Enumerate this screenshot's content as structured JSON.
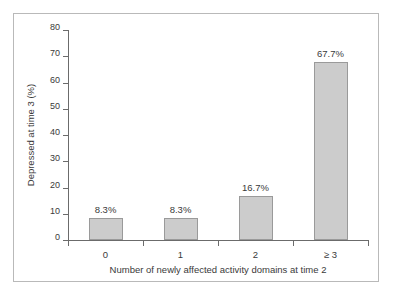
{
  "chart_data": {
    "type": "bar",
    "title": "",
    "categories": [
      "0",
      "1",
      "2",
      "≥ 3"
    ],
    "values": [
      8.3,
      8.3,
      16.7,
      67.7
    ],
    "data_labels": [
      "8.3%",
      "8.3%",
      "16.7%",
      "67.7%"
    ],
    "xlabel": "Number of newly affected activity domains at time 2",
    "ylabel": "Depressed at time 3 (%)",
    "ylim": [
      0,
      80
    ],
    "ytick_labels": [
      "0",
      "10",
      "20",
      "30",
      "40",
      "50",
      "60",
      "70",
      "80"
    ],
    "ytick_values": [
      0,
      10,
      20,
      30,
      40,
      50,
      60,
      70,
      80
    ],
    "grid": false,
    "legend": null,
    "bar_fill_color": "#cccccc",
    "bar_edge_color": "#9a9a9a",
    "axis_color": "#6b6b6b",
    "text_color": "#3a3a3a",
    "background_color": "#ffffff",
    "frame_color": "#b9b9b9"
  }
}
